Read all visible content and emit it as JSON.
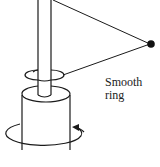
{
  "diagram": {
    "labels": {
      "ring_line1": "Smooth",
      "ring_line2": "ring"
    },
    "colors": {
      "stroke": "#1a1a1a",
      "ball": "#111111",
      "background": "#ffffff"
    }
  }
}
